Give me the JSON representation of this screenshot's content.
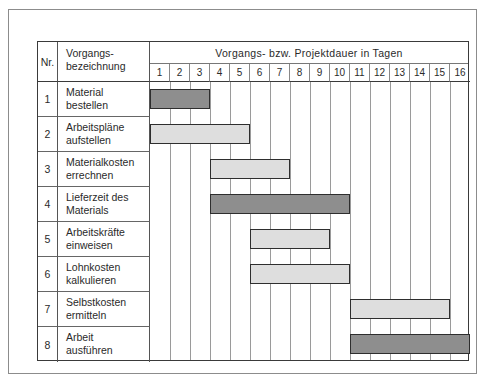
{
  "header": {
    "nr_label": "Nr.",
    "desc_label_line1": "Vorgangs-",
    "desc_label_line2": "bezeichnung",
    "timeline_title": "Vorgangs- bzw. Projektdauer in Tagen",
    "days": [
      "1",
      "2",
      "3",
      "4",
      "5",
      "6",
      "7",
      "8",
      "9",
      "10",
      "11",
      "12",
      "13",
      "14",
      "15",
      "16"
    ]
  },
  "rows": [
    {
      "nr": "1",
      "line1": "Material",
      "line2": "bestellen",
      "start": 1,
      "end": 3,
      "shade": "dark"
    },
    {
      "nr": "2",
      "line1": "Arbeitspläne",
      "line2": "aufstellen",
      "start": 1,
      "end": 5,
      "shade": "light"
    },
    {
      "nr": "3",
      "line1": "Materialkosten",
      "line2": "errechnen",
      "start": 4,
      "end": 7,
      "shade": "light"
    },
    {
      "nr": "4",
      "line1": "Lieferzeit des",
      "line2": "Materials",
      "start": 4,
      "end": 10,
      "shade": "dark"
    },
    {
      "nr": "5",
      "line1": "Arbeitskräfte",
      "line2": "einweisen",
      "start": 6,
      "end": 9,
      "shade": "light"
    },
    {
      "nr": "6",
      "line1": "Lohnkosten",
      "line2": "kalkulieren",
      "start": 6,
      "end": 10,
      "shade": "light"
    },
    {
      "nr": "7",
      "line1": "Selbstkosten",
      "line2": "ermitteln",
      "start": 11,
      "end": 15,
      "shade": "light"
    },
    {
      "nr": "8",
      "line1": "Arbeit",
      "line2": "ausführen",
      "start": 11,
      "end": 16,
      "shade": "dark"
    }
  ],
  "colors": {
    "dark_bar": "#8e8e8e",
    "light_bar": "#dedede",
    "bar_border": "#2e2e2e",
    "grid": "#9a9a9a"
  },
  "chart_data": {
    "type": "gantt",
    "title": "Vorgangs- bzw. Projektdauer in Tagen",
    "xlabel": "Tage",
    "ylabel": "Vorgangsbezeichnung",
    "x_ticks": [
      1,
      2,
      3,
      4,
      5,
      6,
      7,
      8,
      9,
      10,
      11,
      12,
      13,
      14,
      15,
      16
    ],
    "xlim": [
      1,
      16
    ],
    "grid": true,
    "tasks": [
      {
        "nr": 1,
        "name": "Material bestellen",
        "start_day": 1,
        "end_day": 3,
        "duration": 3,
        "shade": "dark"
      },
      {
        "nr": 2,
        "name": "Arbeitspläne aufstellen",
        "start_day": 1,
        "end_day": 5,
        "duration": 5,
        "shade": "light"
      },
      {
        "nr": 3,
        "name": "Materialkosten errechnen",
        "start_day": 4,
        "end_day": 7,
        "duration": 4,
        "shade": "light"
      },
      {
        "nr": 4,
        "name": "Lieferzeit des Materials",
        "start_day": 4,
        "end_day": 10,
        "duration": 7,
        "shade": "dark"
      },
      {
        "nr": 5,
        "name": "Arbeitskräfte einweisen",
        "start_day": 6,
        "end_day": 9,
        "duration": 4,
        "shade": "light"
      },
      {
        "nr": 6,
        "name": "Lohnkosten kalkulieren",
        "start_day": 6,
        "end_day": 10,
        "duration": 5,
        "shade": "light"
      },
      {
        "nr": 7,
        "name": "Selbstkosten ermitteln",
        "start_day": 11,
        "end_day": 15,
        "duration": 5,
        "shade": "light"
      },
      {
        "nr": 8,
        "name": "Arbeit ausführen",
        "start_day": 11,
        "end_day": 16,
        "duration": 6,
        "shade": "dark"
      }
    ]
  }
}
